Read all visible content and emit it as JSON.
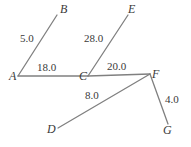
{
  "figure": {
    "type": "node-link-graph",
    "background_color": "#ffffff",
    "edge_color": "#808080",
    "text_color": "#3a3a3a",
    "width": 191,
    "height": 147
  },
  "nodes": [
    {
      "id": "A",
      "label": "A",
      "x": 18,
      "y": 76,
      "label_x": 9,
      "label_y": 70
    },
    {
      "id": "B",
      "label": "B",
      "x": 57,
      "y": 15,
      "label_x": 60,
      "label_y": 3
    },
    {
      "id": "C",
      "label": "C",
      "x": 88,
      "y": 76,
      "label_x": 79,
      "label_y": 70
    },
    {
      "id": "E",
      "label": "E",
      "x": 128,
      "y": 15,
      "label_x": 128,
      "label_y": 3
    },
    {
      "id": "F",
      "label": "F",
      "x": 150,
      "y": 74,
      "label_x": 152,
      "label_y": 68
    },
    {
      "id": "D",
      "label": "D",
      "x": 58,
      "y": 128,
      "label_x": 47,
      "label_y": 123
    },
    {
      "id": "G",
      "label": "G",
      "x": 168,
      "y": 124,
      "label_x": 163,
      "label_y": 124
    }
  ],
  "edges": [
    {
      "id": "A-B",
      "from": "A",
      "to": "B",
      "weight": "5.0",
      "label_x": 20,
      "label_y": 33
    },
    {
      "id": "A-C",
      "from": "A",
      "to": "C",
      "weight": "18.0",
      "label_x": 37,
      "label_y": 62
    },
    {
      "id": "C-E",
      "from": "C",
      "to": "E",
      "weight": "28.0",
      "label_x": 84,
      "label_y": 33
    },
    {
      "id": "C-F",
      "from": "C",
      "to": "F",
      "weight": "20.0",
      "label_x": 107,
      "label_y": 61
    },
    {
      "id": "D-F",
      "from": "D",
      "to": "F",
      "weight": "8.0",
      "label_x": 85,
      "label_y": 90
    },
    {
      "id": "F-G",
      "from": "F",
      "to": "G",
      "weight": "4.0",
      "label_x": 165,
      "label_y": 94
    }
  ]
}
